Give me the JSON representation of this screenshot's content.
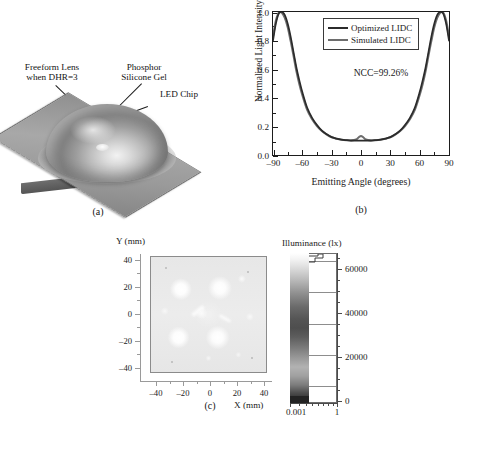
{
  "figure": {
    "panel_labels": {
      "a": "(a)",
      "b": "(b)",
      "c": "(c)"
    }
  },
  "panel_a": {
    "name": "led-freeform-lens-3d-render",
    "annotations": [
      {
        "id": "freeform-lens",
        "line1": "Freeform Lens",
        "line2": "when DHR=3"
      },
      {
        "id": "phosphor-silicone-gel",
        "line1": "Phosphor",
        "line2": "Silicone Gel"
      },
      {
        "id": "led-chip",
        "line1": "LED Chip",
        "line2": ""
      }
    ],
    "colors": {
      "plate": "#9a9a9a",
      "plate_edge": "#6f6f6f",
      "dome_light": "#f2f2f2",
      "dome_dark": "#7f7f7f",
      "leader_line": "#1b1b1b"
    }
  },
  "chart_data": [
    {
      "id": "lidc-curve",
      "type": "line",
      "title": "",
      "xlabel": "Emitting Angle (degrees)",
      "ylabel": "Normalized Light Intensity",
      "xlim": [
        -90,
        90
      ],
      "ylim": [
        0.0,
        1.0
      ],
      "xticks": [
        -90,
        -60,
        -30,
        0,
        30,
        60,
        90
      ],
      "xtick_labels": [
        "–90",
        "–60",
        "–30",
        "0",
        "30",
        "60",
        "90"
      ],
      "yticks": [
        0.0,
        0.2,
        0.4,
        0.6,
        0.8,
        1.0
      ],
      "ytick_labels": [
        "0.0",
        "0.2",
        "0.4",
        "0.6",
        "0.8",
        "1.0"
      ],
      "minor_ticks": true,
      "grid": false,
      "legend_position": "top-center",
      "annotation": "NCC=99.26%",
      "series": [
        {
          "name": "Optimized LIDC",
          "color": "#2b2b2b",
          "linewidth": 1.7,
          "x": [
            -90,
            -87,
            -84,
            -81,
            -78,
            -75,
            -72,
            -69,
            -66,
            -63,
            -60,
            -55,
            -50,
            -45,
            -40,
            -35,
            -30,
            -25,
            -20,
            -15,
            -10,
            -5,
            -2,
            0,
            2,
            5,
            10,
            15,
            20,
            25,
            30,
            35,
            40,
            45,
            50,
            55,
            60,
            63,
            66,
            69,
            72,
            75,
            78,
            81,
            84,
            87,
            90
          ],
          "y": [
            0.8,
            0.92,
            0.99,
            1.0,
            0.98,
            0.92,
            0.83,
            0.72,
            0.61,
            0.52,
            0.44,
            0.33,
            0.26,
            0.21,
            0.17,
            0.145,
            0.125,
            0.115,
            0.108,
            0.104,
            0.101,
            0.1,
            0.1,
            0.1,
            0.1,
            0.1,
            0.101,
            0.104,
            0.108,
            0.115,
            0.125,
            0.145,
            0.17,
            0.21,
            0.26,
            0.33,
            0.44,
            0.52,
            0.61,
            0.72,
            0.83,
            0.92,
            0.98,
            1.0,
            0.99,
            0.92,
            0.8
          ]
        },
        {
          "name": "Simulated LIDC",
          "color": "#6d6d6d",
          "linewidth": 2.1,
          "x": [
            -90,
            -87,
            -84,
            -81,
            -78,
            -75,
            -72,
            -69,
            -66,
            -63,
            -60,
            -55,
            -50,
            -45,
            -40,
            -35,
            -30,
            -25,
            -20,
            -15,
            -10,
            -5,
            -2,
            0,
            2,
            5,
            10,
            15,
            20,
            25,
            30,
            35,
            40,
            45,
            50,
            55,
            60,
            63,
            66,
            69,
            72,
            75,
            78,
            81,
            84,
            87,
            90
          ],
          "y": [
            0.83,
            0.94,
            0.995,
            0.995,
            0.96,
            0.895,
            0.8,
            0.695,
            0.585,
            0.495,
            0.42,
            0.315,
            0.25,
            0.203,
            0.168,
            0.143,
            0.124,
            0.114,
            0.107,
            0.103,
            0.102,
            0.108,
            0.126,
            0.133,
            0.126,
            0.108,
            0.102,
            0.103,
            0.107,
            0.114,
            0.124,
            0.143,
            0.168,
            0.203,
            0.25,
            0.315,
            0.42,
            0.495,
            0.585,
            0.695,
            0.8,
            0.895,
            0.96,
            0.995,
            0.995,
            0.94,
            0.83
          ]
        }
      ]
    },
    {
      "id": "illuminance-map",
      "type": "heatmap",
      "title": "",
      "xlabel": "X (mm)",
      "ylabel": "Y (mm)",
      "xlim": [
        -45,
        45
      ],
      "ylim": [
        -45,
        45
      ],
      "xticks": [
        -40,
        -20,
        0,
        20,
        40
      ],
      "xtick_labels": [
        "–40",
        "–20",
        "0",
        "20",
        "40"
      ],
      "yticks": [
        -40,
        -20,
        0,
        20,
        40
      ],
      "ytick_labels": [
        "40",
        "20",
        "0",
        "–20",
        "–40"
      ],
      "colorbar": {
        "title": "Illuminance (lx)",
        "unit": "lx",
        "ticks": [
          0,
          20000,
          40000,
          60000
        ],
        "tick_labels": [
          "0",
          "20000",
          "40000",
          "60000"
        ],
        "range": [
          0,
          65000
        ],
        "bottom_axis_labels": [
          "0.001",
          "1"
        ],
        "scale_note": "log pixel-count axis"
      },
      "description": "Near-uniform light-gray illuminance distribution with diffuse bright spots"
    }
  ],
  "panel_b": {
    "legend": [
      {
        "label": "Optimized LIDC",
        "color": "#2b2b2b"
      },
      {
        "label": "Simulated LIDC",
        "color": "#6d6d6d"
      }
    ],
    "ncc_text": "NCC=99.26%"
  },
  "panel_c": {
    "y_axis_name": "Y (mm)",
    "x_axis_name": "X (mm)",
    "colorbar_title": "Illuminance (lx)"
  }
}
